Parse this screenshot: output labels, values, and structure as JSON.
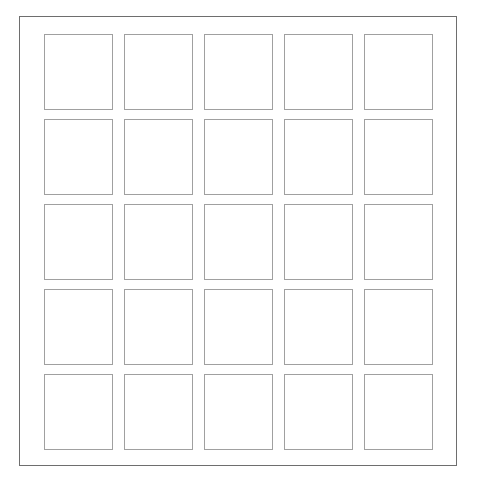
{
  "board": {
    "name": "empty-square-grid",
    "rows": 5,
    "columns": 5,
    "total_cells": 25,
    "frame": {
      "border_color": "#6e6e6e",
      "background_color": "#ffffff",
      "width_px": 438,
      "height_px": 450
    },
    "cell": {
      "border_color": "#a0a0a0",
      "fill_color": "#ffffff",
      "width_px": 69,
      "height_px": 76,
      "column_gap_px": 11,
      "row_gap_px": 9
    },
    "page_background": "#ffffff",
    "rows_data": [
      {
        "index": 0,
        "cells": [
          {
            "row": 0,
            "col": 0,
            "label": ""
          },
          {
            "row": 0,
            "col": 1,
            "label": ""
          },
          {
            "row": 0,
            "col": 2,
            "label": ""
          },
          {
            "row": 0,
            "col": 3,
            "label": ""
          },
          {
            "row": 0,
            "col": 4,
            "label": ""
          }
        ]
      },
      {
        "index": 1,
        "cells": [
          {
            "row": 1,
            "col": 0,
            "label": ""
          },
          {
            "row": 1,
            "col": 1,
            "label": ""
          },
          {
            "row": 1,
            "col": 2,
            "label": ""
          },
          {
            "row": 1,
            "col": 3,
            "label": ""
          },
          {
            "row": 1,
            "col": 4,
            "label": ""
          }
        ]
      },
      {
        "index": 2,
        "cells": [
          {
            "row": 2,
            "col": 0,
            "label": ""
          },
          {
            "row": 2,
            "col": 1,
            "label": ""
          },
          {
            "row": 2,
            "col": 2,
            "label": ""
          },
          {
            "row": 2,
            "col": 3,
            "label": ""
          },
          {
            "row": 2,
            "col": 4,
            "label": ""
          }
        ]
      },
      {
        "index": 3,
        "cells": [
          {
            "row": 3,
            "col": 0,
            "label": ""
          },
          {
            "row": 3,
            "col": 1,
            "label": ""
          },
          {
            "row": 3,
            "col": 2,
            "label": ""
          },
          {
            "row": 3,
            "col": 3,
            "label": ""
          },
          {
            "row": 3,
            "col": 4,
            "label": ""
          }
        ]
      },
      {
        "index": 4,
        "cells": [
          {
            "row": 4,
            "col": 0,
            "label": ""
          },
          {
            "row": 4,
            "col": 1,
            "label": ""
          },
          {
            "row": 4,
            "col": 2,
            "label": ""
          },
          {
            "row": 4,
            "col": 3,
            "label": ""
          },
          {
            "row": 4,
            "col": 4,
            "label": ""
          }
        ]
      }
    ]
  }
}
